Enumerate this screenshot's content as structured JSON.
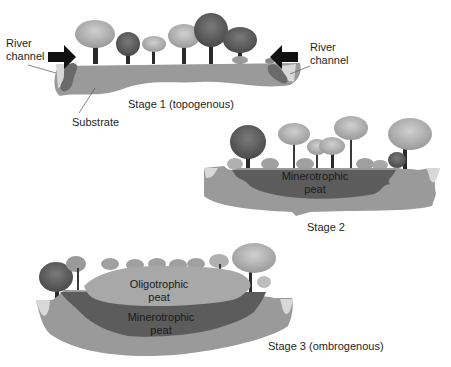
{
  "stage1": {
    "title": "Stage 1 (topogenous)",
    "left_label_line1": "River",
    "left_label_line2": "channel",
    "right_label_line1": "River",
    "right_label_line2": "channel",
    "substrate_label": "Substrate"
  },
  "stage2": {
    "title": "Stage 2",
    "peat_line1": "Minerotrophic",
    "peat_line2": "peat"
  },
  "stage3": {
    "title": "Stage 3 (ombrogenous)",
    "upper_peat_line1": "Oligotrophic",
    "upper_peat_line2": "peat",
    "lower_peat_line1": "Minerotrophic",
    "lower_peat_line2": "peat"
  },
  "colors": {
    "substrate": "#9a9a9a",
    "minerotrophic_peat": "#5c5c5c",
    "oligotrophic_peat": "#a8a8a8",
    "water": "#d8d8d8",
    "tree_dark": "#555555",
    "tree_light": "#b0b0b0",
    "trunk": "#2a2a2a",
    "arrow": "#111111"
  }
}
